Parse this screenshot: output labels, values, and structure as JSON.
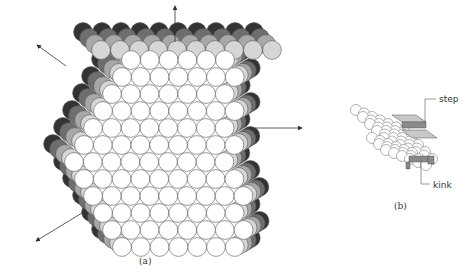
{
  "figure_a": {
    "caption": "(a)",
    "description": "Crystal of close-packed spheres with exposed faces and axis arrows",
    "colors": {
      "front": "#ffffff",
      "layer1": "#d6d6d6",
      "layer2": "#a8a8a8",
      "layer3": "#6e6e6e",
      "layer4": "#333333",
      "stroke": "#555555"
    },
    "arrows": [
      {
        "name": "up",
        "x1": 175,
        "y1": 42,
        "x2": 175,
        "y2": 6
      },
      {
        "name": "upper-left",
        "x1": 66,
        "y1": 66,
        "x2": 37,
        "y2": 45
      },
      {
        "name": "right",
        "x1": 255,
        "y1": 128,
        "x2": 302,
        "y2": 128
      },
      {
        "name": "lower-left",
        "x1": 82,
        "y1": 213,
        "x2": 36,
        "y2": 241
      }
    ]
  },
  "figure_b": {
    "caption": "(b)",
    "labels": {
      "step": "step",
      "kink": "kink"
    }
  }
}
